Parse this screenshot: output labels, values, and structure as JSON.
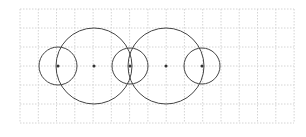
{
  "diagram": {
    "type": "geometric-construction",
    "grid": {
      "x0": 20,
      "y0": 9,
      "x1": 294,
      "y1": 123,
      "x_step": 18.27,
      "y_step": 19,
      "color": "#d4d4d4",
      "dash": "1.5,1.5"
    },
    "circles": [
      {
        "cx": 58,
        "cy": 66,
        "r": 19,
        "center_dot": true
      },
      {
        "cx": 94,
        "cy": 66,
        "r": 38,
        "center_dot": true
      },
      {
        "cx": 130,
        "cy": 66,
        "r": 18,
        "center_dot": true
      },
      {
        "cx": 166,
        "cy": 66,
        "r": 38,
        "center_dot": true
      },
      {
        "cx": 202,
        "cy": 66,
        "r": 18,
        "center_dot": true
      }
    ],
    "stroke_color": "#444444",
    "dot_color": "#333333"
  }
}
